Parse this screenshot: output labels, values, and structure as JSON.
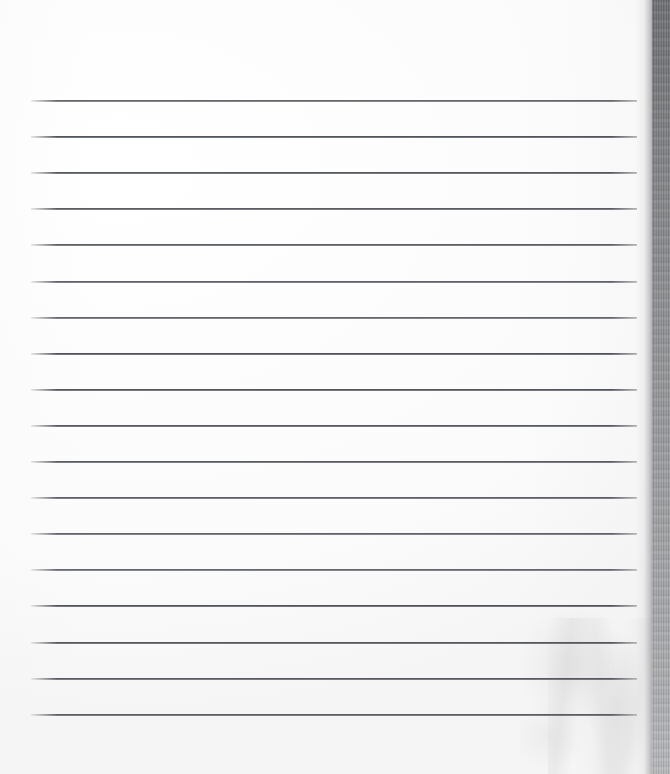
{
  "document": {
    "kind": "scanned-lined-paper",
    "title": "Scanned ruled notebook page",
    "page_width": 670,
    "page_height": 774,
    "content_text": "",
    "is_blank": true,
    "background_color": "#ffffff"
  },
  "paper": {
    "left": 0,
    "top": 0,
    "width": 652,
    "height": 774,
    "color": "#ffffff",
    "smudge": {
      "left": 520,
      "top": 600,
      "width": 132,
      "height": 174,
      "color": "#d8d8d8"
    },
    "crinkle": {
      "left": 548,
      "top": 618,
      "width": 104,
      "height": 156
    }
  },
  "ruled_lines": {
    "count": 18,
    "left": 31,
    "right_end": 637,
    "width": 606,
    "thickness": 2,
    "first_y": 100,
    "spacing": 36.1,
    "color": "#32353a",
    "y_positions": [
      100.0,
      136.1,
      172.2,
      208.3,
      244.4,
      280.5,
      316.6,
      352.7,
      388.8,
      424.9,
      461.0,
      497.1,
      533.2,
      569.3,
      605.4,
      641.5,
      677.6,
      713.7
    ]
  },
  "scan_edge": {
    "label": "scanner-edge-shadow",
    "left": 652,
    "top": 0,
    "width": 18,
    "height": 774,
    "color_top": "#6f7073",
    "color_bottom": "#b8b9bc",
    "falloff": {
      "left": 636,
      "width": 18
    }
  }
}
